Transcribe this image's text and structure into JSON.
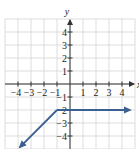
{
  "chart_data": {
    "type": "line",
    "title": "",
    "xlabel": "x",
    "ylabel": "y",
    "xlim": [
      -5,
      5
    ],
    "ylim": [
      -5,
      5
    ],
    "grid": true,
    "x_ticks": [
      -4,
      -3,
      -2,
      -1,
      1,
      2,
      3,
      4
    ],
    "y_ticks": [
      4,
      3,
      2,
      1,
      -1,
      -2,
      -3,
      -4
    ],
    "x_tick_labels": [
      "-4",
      "-3",
      "-2",
      "-1",
      "1",
      "2",
      "3",
      "4"
    ],
    "y_tick_labels": [
      "4",
      "3",
      "2",
      "1",
      "-1",
      "-2",
      "-3",
      "-4"
    ],
    "series": [
      {
        "name": "piecewise",
        "color": "#3b5f8f",
        "points": [
          [
            -4,
            -5
          ],
          [
            -1,
            -2
          ],
          [
            4.6,
            -2
          ]
        ],
        "arrows": [
          "start",
          "end"
        ],
        "description": "y = x - 1 for x < -1; y = -2 for x >= -1"
      }
    ]
  },
  "colors": {
    "grid": "#d4d4d4",
    "axis": "#333333",
    "line": "#3b5f8f"
  },
  "labels": {
    "x_axis": "x",
    "y_axis": "y"
  }
}
